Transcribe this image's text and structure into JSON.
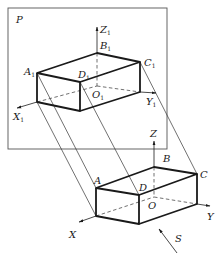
{
  "figure": {
    "plane_label": "P",
    "projection_direction_label": "S",
    "projected_box": {
      "vertex_labels": {
        "A": "A",
        "A_sub": "1",
        "B": "B",
        "B_sub": "1",
        "C": "C",
        "C_sub": "1",
        "D": "D",
        "D_sub": "1",
        "O": "O",
        "O_sub": "1"
      },
      "axis_labels": {
        "X": "X",
        "X_sub": "1",
        "Y": "Y",
        "Y_sub": "1",
        "Z": "Z",
        "Z_sub": "1"
      }
    },
    "spatial_box": {
      "vertex_labels": {
        "A": "A",
        "B": "B",
        "C": "C",
        "D": "D",
        "O": "O"
      },
      "axis_labels": {
        "X": "X",
        "Y": "Y",
        "Z": "Z"
      }
    },
    "colors": {
      "line": "#1a1a1a",
      "frame": "#555555",
      "background": "#ffffff"
    }
  }
}
